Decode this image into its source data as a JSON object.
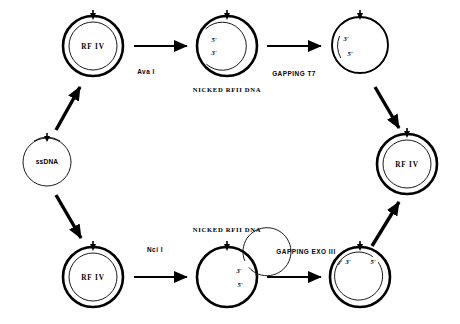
{
  "diagram": {
    "background_color": "#ffffff",
    "stroke_color": "#000000",
    "nodes": [
      {
        "id": "ssdna",
        "label": "ssDNA",
        "kind": "single-circle",
        "cx": 47,
        "cy": 162,
        "r": 24,
        "end_labels": []
      },
      {
        "id": "rfiv-top",
        "label": "RF IV",
        "kind": "double-circle",
        "cx": 93,
        "cy": 46,
        "r": 30,
        "end_labels": []
      },
      {
        "id": "nicked-rfii-top",
        "label": "",
        "kind": "double-circle-nicked",
        "cx": 227,
        "cy": 46,
        "r": 30,
        "caption": "NICKED RFII DNA",
        "end_labels": [
          "5'",
          "3'"
        ]
      },
      {
        "id": "gapped-top",
        "label": "",
        "kind": "single-circle-gapped",
        "cx": 360,
        "cy": 45,
        "r": 28,
        "end_labels": [
          "3'",
          "5'"
        ]
      },
      {
        "id": "rfiv-right",
        "label": "RF IV",
        "kind": "double-circle",
        "cx": 407,
        "cy": 164,
        "r": 30,
        "end_labels": []
      },
      {
        "id": "rfiv-bottom",
        "label": "RF IV",
        "kind": "double-circle",
        "cx": 93,
        "cy": 277,
        "r": 30,
        "end_labels": []
      },
      {
        "id": "nicked-rfii-bottom",
        "label": "",
        "kind": "double-circle-nicked",
        "cx": 227,
        "cy": 277,
        "r": 30,
        "caption": "NICKED RFII DNA",
        "end_labels": [
          "3'",
          "5'"
        ]
      },
      {
        "id": "gapped-bottom",
        "label": "",
        "kind": "double-circle-gapped",
        "cx": 360,
        "cy": 277,
        "r": 30,
        "end_labels": [
          "3'",
          "5'"
        ]
      }
    ],
    "edges": [
      {
        "id": "ssdna-to-rfiv-top",
        "type": "diagonal",
        "label": ""
      },
      {
        "id": "rfiv-top-to-nicked-top",
        "type": "horizontal",
        "label": "Ava I"
      },
      {
        "id": "nicked-top-to-gapped-top",
        "type": "horizontal",
        "label": "GAPPING T7"
      },
      {
        "id": "gapped-top-to-rfiv-right",
        "type": "diagonal",
        "label": ""
      },
      {
        "id": "ssdna-to-rfiv-bottom",
        "type": "diagonal",
        "label": ""
      },
      {
        "id": "rfiv-bottom-to-nicked-bottom",
        "type": "horizontal",
        "label": "Nci I"
      },
      {
        "id": "nicked-bottom-to-gapped-bottom",
        "type": "horizontal",
        "label": "GAPPING EXO III"
      },
      {
        "id": "gapped-bottom-to-rfiv-right",
        "type": "diagonal",
        "label": ""
      }
    ],
    "text_labels": {
      "ssdna": "ssDNA",
      "rfiv_top": "RF IV",
      "rfiv_right": "RF IV",
      "rfiv_bottom": "RF IV",
      "ava_i": "Ava I",
      "gapping_t7": "GAPPING T7",
      "nci_i": "Nci I",
      "gapping_exo_iii": "GAPPING EXO III",
      "nicked_rfii_top": "NICKED RFII DNA",
      "nicked_rfii_bottom": "NICKED RFII DNA",
      "five_prime": "5'",
      "three_prime": "3'"
    }
  }
}
